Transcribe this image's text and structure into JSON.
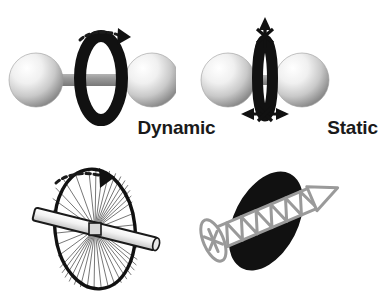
{
  "figure": {
    "background_color": "#ffffff"
  },
  "panels": {
    "dynamic": {
      "caption": "Dynamic",
      "description": "Two spheres joined by a rod with a black ring rotating about the rod axis",
      "rotation_arrow": "curved-dashed-clockwise-arrow",
      "sphere_count": 2,
      "ring_state": "rotating"
    },
    "static": {
      "caption": "Static",
      "description": "Two spheres close together with a narrow black ring locked in place; crossed-out motion arrows",
      "blocked_arrow_vertical": "crossed-out-vertical-double-arrow",
      "blocked_arrow_horizontal": "crossed-out-horizontal-double-arrow",
      "sphere_count": 2,
      "ring_state": "locked"
    },
    "wheel": {
      "description": "Spoked bicycle wheel free to spin on its axle rod",
      "rotation_arrow": "curved-dashed-clockwise-arrow",
      "spoke_count": 26,
      "state": "free-spinning"
    },
    "screw": {
      "description": "Screw driven through a black elliptical disk, fixing it in place",
      "state": "fastened"
    }
  },
  "colors": {
    "ring": "#111111",
    "rod": "#8f8f8f",
    "sphere_highlight": "#ffffff",
    "sphere_shadow": "#8a8a8a",
    "screw": "#9a9a9a",
    "disk": "#111111",
    "text": "#1a1a1a",
    "background": "#ffffff"
  }
}
